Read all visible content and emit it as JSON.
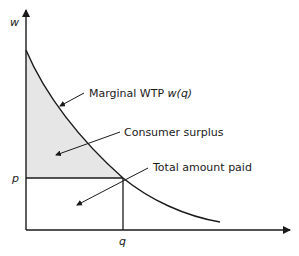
{
  "diagram": {
    "axes": {
      "y_label": "w",
      "x_label": "",
      "price_tick": "p",
      "quantity_tick": "q"
    },
    "annotations": {
      "curve_label_prefix": "Marginal WTP ",
      "curve_label_func": "w(q)",
      "surplus_label": "Consumer surplus",
      "paid_label": "Total amount paid"
    },
    "colors": {
      "line": "#1a1a1a",
      "surplus_fill": "#e6e6e6",
      "background": "#ffffff"
    }
  }
}
